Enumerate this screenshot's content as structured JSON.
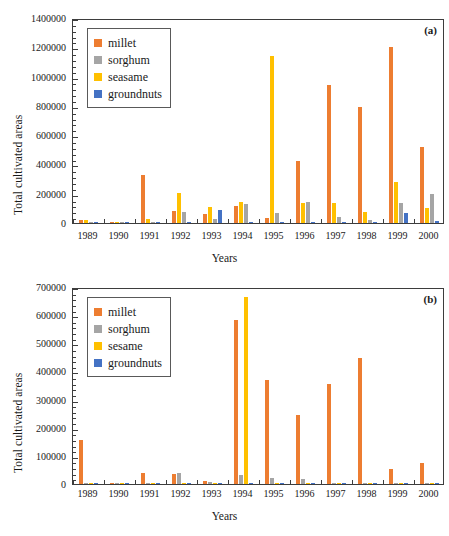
{
  "figure": {
    "width": 449,
    "height": 536,
    "background": "#ffffff"
  },
  "colors": {
    "millet": "#ED7D31",
    "sorghum": "#A5A5A5",
    "sesame": "#FFC000",
    "sesame_light": "#FFD24D",
    "groundnuts": "#4472C4",
    "axis": "#3d3d3d",
    "text": "#1a1a1a"
  },
  "panel_a": {
    "tag": "(a)",
    "ylabel": "Total cultivated areas",
    "xlabel": "Years",
    "legend": [
      {
        "label": "millet",
        "color": "#ED7D31"
      },
      {
        "label": "sorghum",
        "color": "#A5A5A5"
      },
      {
        "label": "seasame",
        "color": "#FFC000"
      },
      {
        "label": "groundnuts",
        "color": "#4472C4"
      }
    ],
    "yticks": [
      "0",
      "200000",
      "400000",
      "600000",
      "800000",
      "1000000",
      "1200000",
      "1400000"
    ],
    "xticks": [
      "1989",
      "1990",
      "1991",
      "1992",
      "1993",
      "1994",
      "1995",
      "1996",
      "1997",
      "1998",
      "1999",
      "2000"
    ]
  },
  "panel_b": {
    "tag": "(b)",
    "ylabel": "Total cultivated areas",
    "xlabel": "Years",
    "legend": [
      {
        "label": "millet",
        "color": "#ED7D31"
      },
      {
        "label": "sorghum",
        "color": "#A5A5A5"
      },
      {
        "label": "sesame",
        "color": "#FFC000"
      },
      {
        "label": "groundnuts",
        "color": "#4472C4"
      }
    ],
    "yticks": [
      "0",
      "100000",
      "200000",
      "300000",
      "400000",
      "500000",
      "600000",
      "700000"
    ],
    "xticks": [
      "1989",
      "1990",
      "1991",
      "1992",
      "1993",
      "1994",
      "1995",
      "1996",
      "1997",
      "1998",
      "1999",
      "2000"
    ]
  },
  "chart_data": [
    {
      "type": "bar",
      "panel": "(a)",
      "title": "",
      "xlabel": "Years",
      "ylabel": "Total cultivated areas",
      "categories": [
        "1989",
        "1990",
        "1991",
        "1992",
        "1993",
        "1994",
        "1995",
        "1996",
        "1997",
        "1998",
        "1999",
        "2000"
      ],
      "ylim": [
        0,
        1400000
      ],
      "ytick_step": 200000,
      "grid": false,
      "legend_position": "top-left",
      "series": [
        {
          "name": "millet",
          "color": "#ED7D31",
          "values": [
            18000,
            2000,
            325000,
            82000,
            62000,
            115000,
            33000,
            425000,
            940000,
            795000,
            1200000,
            520000
          ]
        },
        {
          "name": "seasame",
          "color": "#FFC000",
          "values": [
            20000,
            2000,
            25000,
            202000,
            112000,
            145000,
            1142000,
            138000,
            135000,
            78000,
            278000,
            102000
          ]
        },
        {
          "name": "sorghum",
          "color": "#A5A5A5",
          "values": [
            3000,
            1500,
            5000,
            78000,
            28000,
            130000,
            70000,
            142000,
            42000,
            22000,
            138000,
            198000
          ]
        },
        {
          "name": "groundnuts",
          "color": "#4472C4",
          "values": [
            2000,
            1000,
            3000,
            4000,
            88000,
            6000,
            5000,
            6000,
            4000,
            5000,
            68000,
            14000
          ]
        }
      ]
    },
    {
      "type": "bar",
      "panel": "(b)",
      "title": "",
      "xlabel": "Years",
      "ylabel": "Total cultivated areas",
      "categories": [
        "1989",
        "1990",
        "1991",
        "1992",
        "1993",
        "1994",
        "1995",
        "1996",
        "1997",
        "1998",
        "1999",
        "2000"
      ],
      "ylim": [
        0,
        700000
      ],
      "ytick_step": 100000,
      "grid": false,
      "legend_position": "top-left",
      "series": [
        {
          "name": "millet",
          "color": "#ED7D31",
          "values": [
            158000,
            1000,
            38000,
            37000,
            12000,
            583000,
            371000,
            247000,
            354000,
            448000,
            52000,
            75000
          ]
        },
        {
          "name": "sorghum",
          "color": "#A5A5A5",
          "values": [
            4000,
            500,
            3000,
            38000,
            7000,
            31000,
            22000,
            18000,
            3000,
            2000,
            1500,
            1500
          ]
        },
        {
          "name": "sesame",
          "color": "#FFC000",
          "values": [
            2000,
            500,
            2000,
            2000,
            2000,
            665000,
            3000,
            2000,
            1500,
            1500,
            1000,
            1000
          ]
        },
        {
          "name": "groundnuts",
          "color": "#4472C4",
          "values": [
            1500,
            500,
            1000,
            1000,
            1000,
            2000,
            1500,
            1500,
            1000,
            1000,
            800,
            800
          ]
        }
      ]
    }
  ]
}
